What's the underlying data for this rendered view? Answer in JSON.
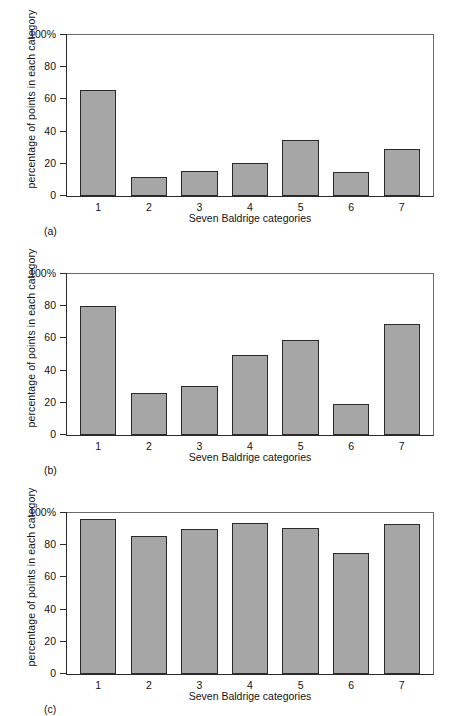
{
  "figure": {
    "shared": {
      "ylabel": "percentage of points in each category",
      "xlabel": "Seven Baldrige categories",
      "categories": [
        "1",
        "2",
        "3",
        "4",
        "5",
        "6",
        "7"
      ],
      "ytick_labels": [
        "100%",
        "80",
        "60",
        "40",
        "20",
        "0"
      ],
      "bar_fill": "#a6a6a6",
      "bar_edge": "#2a2a2a",
      "axis_color": "#2b2b2b",
      "background": "#ffffff"
    },
    "panels": [
      {
        "caption": "(a)"
      },
      {
        "caption": "(b)"
      },
      {
        "caption": "(c)"
      }
    ]
  },
  "chart_data": [
    {
      "type": "bar",
      "title": "",
      "panel": "(a)",
      "categories": [
        "1",
        "2",
        "3",
        "4",
        "5",
        "6",
        "7"
      ],
      "values": [
        66,
        12,
        15.5,
        20.5,
        35,
        15,
        29.5
      ],
      "xlabel": "Seven Baldrige categories",
      "ylabel": "percentage of points in each category",
      "ylim": [
        0,
        100
      ],
      "yticks": [
        0,
        20,
        40,
        60,
        80,
        100
      ],
      "ytick_labels": [
        "0",
        "20",
        "40",
        "60",
        "80",
        "100%"
      ],
      "grid": false,
      "legend": false
    },
    {
      "type": "bar",
      "title": "",
      "panel": "(b)",
      "categories": [
        "1",
        "2",
        "3",
        "4",
        "5",
        "6",
        "7"
      ],
      "values": [
        80,
        26,
        30.5,
        50,
        59,
        19.5,
        69
      ],
      "xlabel": "Seven Baldrige categories",
      "ylabel": "percentage of points in each category",
      "ylim": [
        0,
        100
      ],
      "yticks": [
        0,
        20,
        40,
        60,
        80,
        100
      ],
      "ytick_labels": [
        "0",
        "20",
        "40",
        "60",
        "80",
        "100%"
      ],
      "grid": false,
      "legend": false
    },
    {
      "type": "bar",
      "title": "",
      "panel": "(c)",
      "categories": [
        "1",
        "2",
        "3",
        "4",
        "5",
        "6",
        "7"
      ],
      "values": [
        96,
        86,
        90,
        93.5,
        90.5,
        75,
        93
      ],
      "xlabel": "Seven Baldrige categories",
      "ylabel": "percentage of points in each category",
      "ylim": [
        0,
        100
      ],
      "yticks": [
        0,
        20,
        40,
        60,
        80,
        100
      ],
      "ytick_labels": [
        "0",
        "20",
        "40",
        "60",
        "80",
        "100%"
      ],
      "grid": false,
      "legend": false
    }
  ]
}
